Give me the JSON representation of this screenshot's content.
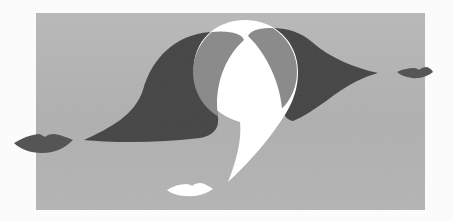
{
  "artwork": {
    "title": "Abstract composition with lips and comma shapes",
    "style": "grayscale surrealist illustration",
    "colors": {
      "page": "#fbfbfb",
      "panel": "#b6b6b6",
      "dark": "#4b4b4b",
      "overlap": "#8e8e8e",
      "white": "#ffffff",
      "lips_dark": "#555555"
    },
    "elements": [
      {
        "name": "gray-panel",
        "desc": "textured gray rectangle background"
      },
      {
        "name": "left-dark-drop",
        "desc": "dark wave/drop shape pointing left"
      },
      {
        "name": "right-dark-drop",
        "desc": "dark wave/drop shape pointing right"
      },
      {
        "name": "white-comma",
        "desc": "large white comma / question mark shape"
      },
      {
        "name": "left-lips",
        "desc": "dark lips at left edge"
      },
      {
        "name": "right-lips",
        "desc": "dark lips at right edge"
      },
      {
        "name": "white-lips",
        "desc": "white lips near bottom center"
      }
    ]
  }
}
